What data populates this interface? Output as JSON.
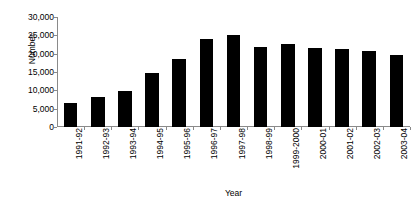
{
  "chart_data": {
    "type": "bar",
    "title": "",
    "xlabel": "Year",
    "ylabel": "Number",
    "categories": [
      "1991-92",
      "1992-93",
      "1993-94",
      "1994-95",
      "1995-96",
      "1996-97",
      "1997-98",
      "1998-99",
      "1999-2000",
      "2000-01",
      "2001-02",
      "2002-03",
      "2003-04"
    ],
    "values": [
      6500,
      8200,
      9800,
      14700,
      18500,
      24000,
      25100,
      21900,
      22700,
      21500,
      21400,
      20700,
      19700
    ],
    "ylim": [
      0,
      30000
    ],
    "ytick_values": [
      0,
      5000,
      10000,
      15000,
      20000,
      25000,
      30000
    ],
    "ytick_labels": [
      "0",
      "5,000",
      "10,000",
      "15,000",
      "20,000",
      "25,000",
      "30,000"
    ],
    "grid": false,
    "legend": false,
    "legend_position": "none",
    "bar_color": "#000000",
    "axis_color": "#8a8a8a",
    "background_color": "#ffffff",
    "xtick_label_rotation": 90
  }
}
